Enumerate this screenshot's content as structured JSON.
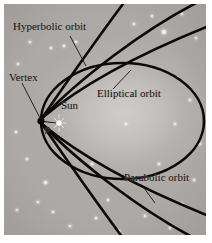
{
  "figure": {
    "background_color": "#ada9a6",
    "ink_color": "#0c0a08",
    "frame_color": "#ffffff"
  },
  "labels": {
    "hyperbolic": "Hyperbolic orbit",
    "elliptical": "Elliptical orbit",
    "parabolic": "Parabolic orbit",
    "vertex": "Vertex",
    "sun": "Sun",
    "p": "p"
  },
  "chart_data": {
    "type": "line",
    "xlabel": "",
    "ylabel": "",
    "annotations": [
      {
        "text": "Hyperbolic orbit",
        "x": 14,
        "y": 22,
        "leader_to": [
          78,
          60
        ]
      },
      {
        "text": "Elliptical orbit",
        "x": 97,
        "y": 90,
        "leader_to": [
          128,
          69
        ]
      },
      {
        "text": "Parabolic orbit",
        "x": 124,
        "y": 175,
        "leader_to": [
          145,
          196
        ]
      },
      {
        "text": "Vertex",
        "x": 9,
        "y": 73,
        "leader_to": [
          37,
          116
        ]
      },
      {
        "text": "Sun",
        "x": 58,
        "y": 104,
        "leader_to": null
      },
      {
        "text": "p",
        "x": 43,
        "y": 124,
        "leader_to": null
      }
    ],
    "markers": [
      {
        "name": "vertex",
        "x": 37,
        "y": 117,
        "kind": "filled-dot"
      },
      {
        "name": "sun",
        "x": 55,
        "y": 119,
        "kind": "sunburst"
      }
    ],
    "series": [
      {
        "name": "Elliptical orbit",
        "closed": true,
        "focus": "Sun",
        "vertex": [
          37,
          117
        ],
        "apoapsis": [
          200,
          117
        ],
        "semi_major_px": 82,
        "semi_minor_px": 58
      },
      {
        "name": "Parabolic orbit",
        "closed": false,
        "vertex": [
          37,
          117
        ],
        "eccentricity": 1.0
      },
      {
        "name": "Hyperbolic orbit",
        "closed": false,
        "count": 2,
        "vertex": [
          37,
          117
        ],
        "eccentricity": ">1"
      }
    ],
    "legend_position": "inline-annotations",
    "grid": false
  },
  "stars": [
    {
      "x": 26,
      "y": 38,
      "r": 1.4
    },
    {
      "x": 47,
      "y": 44,
      "r": 1.1
    },
    {
      "x": 60,
      "y": 42,
      "r": 0.9
    },
    {
      "x": 72,
      "y": 38,
      "r": 1.3
    },
    {
      "x": 14,
      "y": 60,
      "r": 0.9
    },
    {
      "x": 12,
      "y": 128,
      "r": 1.0
    },
    {
      "x": 23,
      "y": 155,
      "r": 1.0
    },
    {
      "x": 41,
      "y": 178,
      "r": 1.5
    },
    {
      "x": 34,
      "y": 198,
      "r": 1.0
    },
    {
      "x": 49,
      "y": 208,
      "r": 1.2
    },
    {
      "x": 13,
      "y": 206,
      "r": 1.1
    },
    {
      "x": 66,
      "y": 222,
      "r": 1.0
    },
    {
      "x": 92,
      "y": 214,
      "r": 0.9
    },
    {
      "x": 115,
      "y": 227,
      "r": 1.1
    },
    {
      "x": 141,
      "y": 212,
      "r": 1.3
    },
    {
      "x": 166,
      "y": 224,
      "r": 1.0
    },
    {
      "x": 178,
      "y": 200,
      "r": 1.2
    },
    {
      "x": 190,
      "y": 176,
      "r": 0.9
    },
    {
      "x": 196,
      "y": 140,
      "r": 1.0
    },
    {
      "x": 171,
      "y": 120,
      "r": 1.4
    },
    {
      "x": 186,
      "y": 96,
      "r": 1.0
    },
    {
      "x": 160,
      "y": 28,
      "r": 1.8
    },
    {
      "x": 148,
      "y": 12,
      "r": 1.2
    },
    {
      "x": 178,
      "y": 10,
      "r": 1.4
    },
    {
      "x": 192,
      "y": 34,
      "r": 1.0
    },
    {
      "x": 130,
      "y": 20,
      "r": 0.9
    },
    {
      "x": 104,
      "y": 196,
      "r": 0.8
    },
    {
      "x": 155,
      "y": 160,
      "r": 0.8
    },
    {
      "x": 88,
      "y": 160,
      "r": 0.7
    },
    {
      "x": 122,
      "y": 120,
      "r": 0.9
    }
  ]
}
